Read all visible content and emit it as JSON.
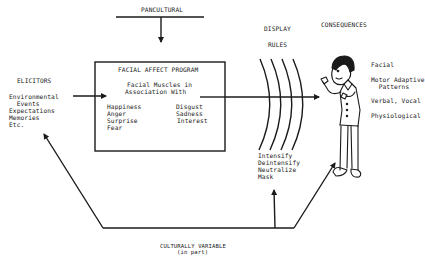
{
  "pancultural": {
    "label": "PANCULTURAL"
  },
  "elicitors": {
    "title": "ELICITORS",
    "items": [
      "Environmental",
      "  Events",
      "Expectations",
      "Memories",
      "Etc."
    ]
  },
  "facial_affect_program": {
    "title": "FACIAL AFFECT PROGRAM",
    "subtitle_line1": "Facial Muscles in",
    "subtitle_line2": "Association With",
    "emotions_left": [
      "Happiness",
      "Anger",
      "Surprise",
      "Fear"
    ],
    "emotions_right": [
      "Disgust",
      "Sadness",
      "Interest"
    ]
  },
  "display_rules": {
    "title_line1": "DISPLAY",
    "title_line2": "RULES",
    "items": [
      "Intensify",
      "Deintensify",
      "Neutralize",
      "Mask"
    ]
  },
  "consequences": {
    "title": "CONSEQUENCES",
    "items": [
      "Facial",
      "Motor Adaptive",
      "  Patterns",
      "Verbal, Vocal",
      "Physiological"
    ]
  },
  "culturally_variable": {
    "label_line1": "CULTURALLY VARIABLE",
    "label_line2": "(in part)"
  },
  "colors": {
    "ink": "#1a1a1a",
    "background": "#ffffff"
  }
}
